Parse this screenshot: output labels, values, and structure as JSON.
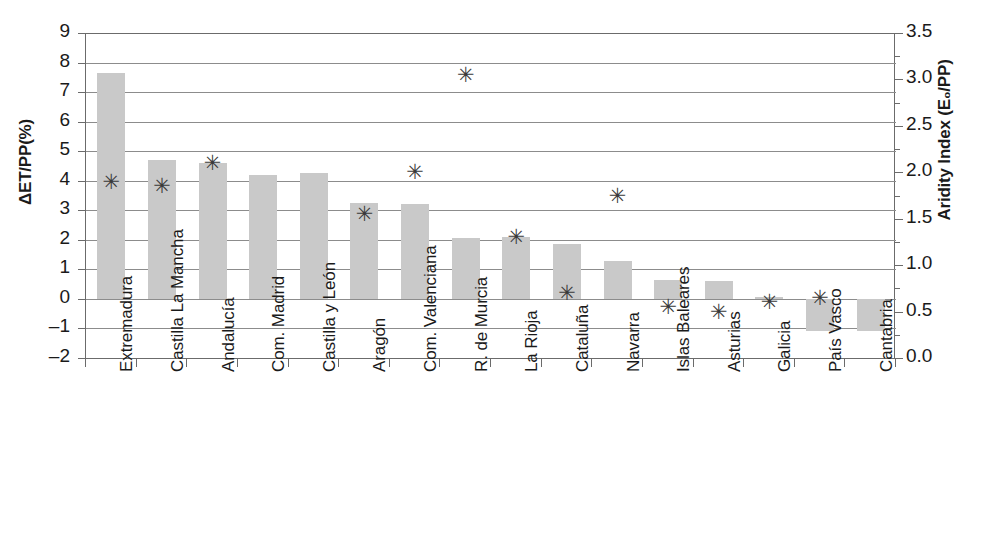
{
  "chart_data": {
    "type": "bar",
    "title": "",
    "xlabel": "",
    "ylabel": "ΔET/PP(%)",
    "y2label": "Aridity Index (E₀/PP)",
    "ylim": [
      -2,
      9
    ],
    "y2lim": [
      0.0,
      3.5
    ],
    "grid": true,
    "legend": "none",
    "categories": [
      "Extremadura",
      "Castilla La Mancha",
      "Andalucía",
      "Com. Madrid",
      "Castilla y León",
      "Aragón",
      "Com. Valenciana",
      "R. de Murcia",
      "La Rioja",
      "Cataluña",
      "Navarra",
      "Islas Baleares",
      "Asturias",
      "Galicia",
      "País Vasco",
      "Cantabria"
    ],
    "series": [
      {
        "name": "ΔET/PP(%)",
        "axis": "left",
        "type": "bar",
        "values": [
          7.65,
          4.7,
          4.6,
          4.2,
          4.25,
          3.25,
          3.2,
          2.05,
          2.1,
          1.85,
          1.3,
          0.65,
          0.6,
          0.05,
          -1.1,
          -1.1
        ]
      },
      {
        "name": "Aridity Index (E₀/PP)",
        "axis": "right",
        "type": "scatter",
        "marker": "asterisk",
        "values_left_scale": [
          3.95,
          3.8,
          4.55,
          null,
          null,
          3.1,
          4.2,
          7.7,
          2.25,
          0.55,
          3.55,
          -0.2,
          -0.4,
          0.0,
          0.2,
          null
        ],
        "values": [
          1.9,
          1.85,
          2.1,
          null,
          null,
          1.55,
          2.0,
          3.05,
          1.3,
          0.7,
          1.75,
          0.55,
          0.5,
          0.6,
          0.65,
          null
        ]
      }
    ],
    "y_ticks": [
      "9",
      "8",
      "7",
      "6",
      "5",
      "4",
      "3",
      "2",
      "1",
      "0",
      "-1",
      "-2"
    ],
    "y2_ticks": [
      "3.5",
      "3.0",
      "2.5",
      "2.0",
      "1.5",
      "1.0",
      "0.5",
      "0.0"
    ],
    "colors": {
      "bar_fill": "#c9c9c9",
      "marker": "#3a3a3a",
      "axis": "#6b6b6b",
      "grid": "#8c8c8c",
      "background": "#ffffff"
    }
  }
}
